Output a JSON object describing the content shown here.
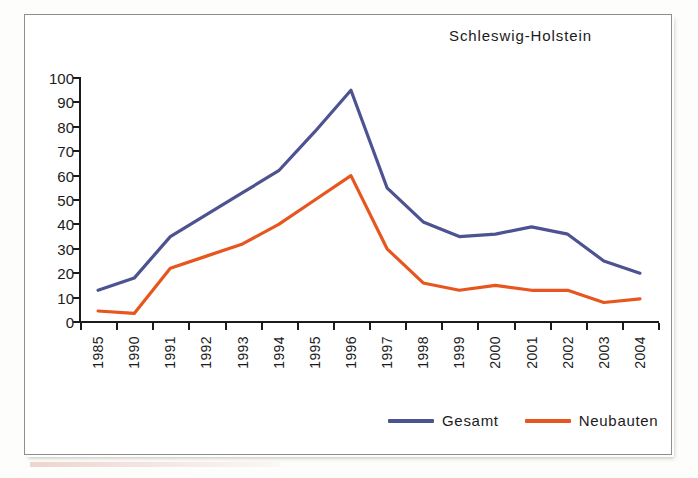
{
  "chart_data": {
    "type": "line",
    "title": "Schleswig-Holstein",
    "xlabel": "",
    "ylabel": "",
    "ylim": [
      0,
      100
    ],
    "ytick_step": 10,
    "yticks": [
      100,
      90,
      80,
      70,
      60,
      50,
      40,
      30,
      20,
      10,
      0
    ],
    "grid": false,
    "legend_position": "bottom-right",
    "categories": [
      "1985",
      "1990",
      "1991",
      "1992",
      "1993",
      "1994",
      "1995",
      "1996",
      "1997",
      "1998",
      "1999",
      "2000",
      "2001",
      "2002",
      "2003",
      "2004"
    ],
    "series": [
      {
        "name": "Gesamt",
        "color": "#4d5291",
        "values": [
          13,
          18,
          35,
          44,
          53,
          62,
          78,
          95,
          55,
          41,
          35,
          36,
          39,
          36,
          25,
          20
        ]
      },
      {
        "name": "Neubauten",
        "color": "#e8561f",
        "values": [
          4.5,
          3.5,
          22,
          27,
          32,
          40,
          50,
          60,
          30,
          16,
          13,
          15,
          13,
          13,
          8,
          9.5
        ]
      }
    ]
  },
  "legend": {
    "items": [
      {
        "label": "Gesamt",
        "color": "#4d5291"
      },
      {
        "label": "Neubauten",
        "color": "#e8561f"
      }
    ]
  },
  "axis": {
    "line_color": "#1b1b1b"
  }
}
